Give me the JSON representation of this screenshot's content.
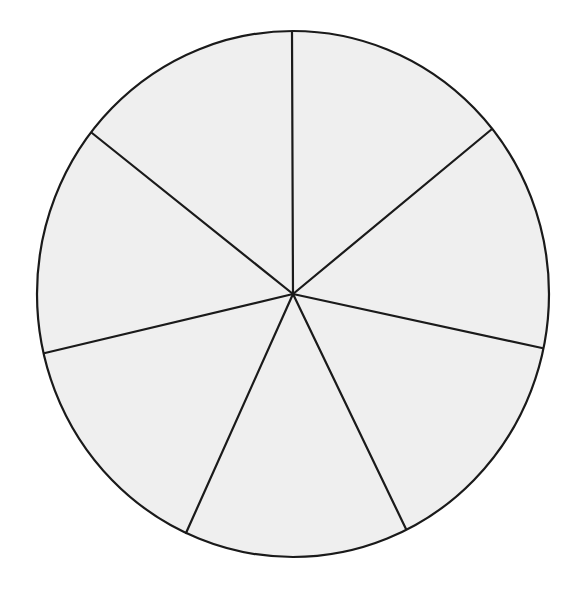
{
  "diagram": {
    "type": "blank-segmented-wheel",
    "segment_count": 7,
    "fill_color": "#efefef",
    "stroke_color": "#1a1a1a",
    "background_color": "#ffffff",
    "center": [
      293,
      294
    ],
    "radius_x": 256,
    "radius_y": 263,
    "spoke_endpoints": [
      [
        292,
        32
      ],
      [
        492,
        129
      ],
      [
        542,
        348
      ],
      [
        406,
        529
      ],
      [
        186,
        533
      ],
      [
        45,
        353
      ],
      [
        92,
        133
      ]
    ],
    "labels": []
  }
}
